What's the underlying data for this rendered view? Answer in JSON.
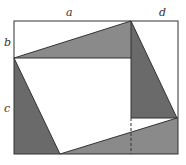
{
  "diagram": {
    "type": "geometry-proof",
    "labels": {
      "a": "a",
      "d": "d",
      "b": "b",
      "c": "c"
    },
    "colors": {
      "outline": "#333333",
      "light_shade": "#8a8a8a",
      "dark_shade": "#6a6a6a",
      "background": "#ffffff"
    },
    "points": {
      "outer_rect": {
        "x1": 14,
        "y1": 21,
        "x2": 178,
        "y2": 154
      },
      "P_left": [
        14,
        58
      ],
      "P_top": [
        131,
        21
      ],
      "P_right": [
        177,
        118
      ],
      "P_bottom": [
        60,
        154
      ]
    }
  }
}
